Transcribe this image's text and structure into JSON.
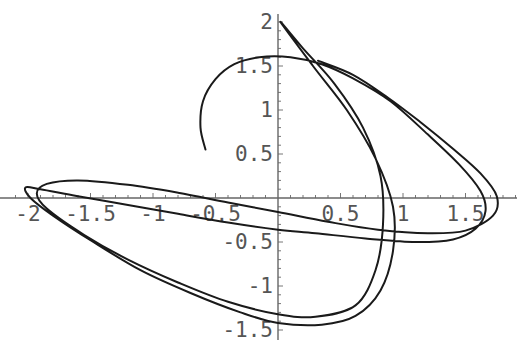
{
  "chart_data": {
    "type": "line",
    "title": "",
    "xlabel": "",
    "ylabel": "",
    "xlim": [
      -2.1,
      1.9
    ],
    "ylim": [
      -1.5,
      2.0
    ],
    "grid": false,
    "legend": null,
    "x_ticks": [
      "-2",
      "-1.5",
      "-1",
      "-0.5",
      "0.5",
      "1",
      "1.5"
    ],
    "y_ticks": [
      "2",
      "1.5",
      "1",
      "0.5",
      "-0.5",
      "-1",
      "-1.5"
    ],
    "series": [
      {
        "name": "parametric curve",
        "points": [
          [
            -0.58,
            0.55
          ],
          [
            -0.62,
            0.8
          ],
          [
            -0.6,
            1.1
          ],
          [
            -0.5,
            1.35
          ],
          [
            -0.35,
            1.52
          ],
          [
            -0.15,
            1.6
          ],
          [
            0.1,
            1.6
          ],
          [
            0.35,
            1.52
          ],
          [
            0.6,
            1.36
          ],
          [
            0.9,
            1.1
          ],
          [
            1.2,
            0.72
          ],
          [
            1.45,
            0.38
          ],
          [
            1.62,
            0.08
          ],
          [
            1.66,
            -0.15
          ],
          [
            1.58,
            -0.35
          ],
          [
            1.4,
            -0.47
          ],
          [
            1.1,
            -0.5
          ],
          [
            0.7,
            -0.46
          ],
          [
            0.3,
            -0.4
          ],
          [
            0.0,
            -0.36
          ],
          [
            -0.4,
            -0.28
          ],
          [
            -0.8,
            -0.18
          ],
          [
            -1.2,
            -0.08
          ],
          [
            -1.6,
            0.02
          ],
          [
            -1.9,
            0.1
          ],
          [
            -2.02,
            0.12
          ],
          [
            -1.98,
            0.0
          ],
          [
            -1.8,
            -0.2
          ],
          [
            -1.5,
            -0.48
          ],
          [
            -1.1,
            -0.82
          ],
          [
            -0.7,
            -1.08
          ],
          [
            -0.3,
            -1.3
          ],
          [
            0.0,
            -1.42
          ],
          [
            0.35,
            -1.44
          ],
          [
            0.62,
            -1.34
          ],
          [
            0.82,
            -1.05
          ],
          [
            0.92,
            -0.6
          ],
          [
            0.92,
            -0.1
          ],
          [
            0.78,
            0.45
          ],
          [
            0.55,
            1.0
          ],
          [
            0.28,
            1.5
          ],
          [
            0.02,
            2.0
          ],
          [
            0.2,
            1.7
          ],
          [
            0.45,
            1.3
          ],
          [
            0.68,
            0.8
          ],
          [
            0.82,
            0.25
          ],
          [
            0.84,
            -0.3
          ],
          [
            0.78,
            -0.82
          ],
          [
            0.62,
            -1.22
          ],
          [
            0.3,
            -1.35
          ],
          [
            0.0,
            -1.32
          ],
          [
            -0.4,
            -1.18
          ],
          [
            -0.8,
            -0.96
          ],
          [
            -1.2,
            -0.7
          ],
          [
            -1.55,
            -0.42
          ],
          [
            -1.85,
            -0.12
          ],
          [
            -1.93,
            0.05
          ],
          [
            -1.85,
            0.16
          ],
          [
            -1.6,
            0.2
          ],
          [
            -1.2,
            0.15
          ],
          [
            -0.8,
            0.06
          ],
          [
            -0.4,
            -0.05
          ],
          [
            0.0,
            -0.16
          ],
          [
            0.4,
            -0.27
          ],
          [
            0.8,
            -0.36
          ],
          [
            1.2,
            -0.4
          ],
          [
            1.5,
            -0.37
          ],
          [
            1.72,
            -0.2
          ],
          [
            1.75,
            0.02
          ],
          [
            1.62,
            0.28
          ],
          [
            1.4,
            0.56
          ],
          [
            1.15,
            0.85
          ],
          [
            0.88,
            1.14
          ],
          [
            0.6,
            1.4
          ],
          [
            0.32,
            1.56
          ]
        ]
      }
    ],
    "axis_origin_px": [
      278,
      198
    ],
    "px_per_unit": [
      125,
      88
    ]
  },
  "axes": {
    "x_tick_labels": [
      {
        "value": -2,
        "label": "-2"
      },
      {
        "value": -1.5,
        "label": "-1.5"
      },
      {
        "value": -1,
        "label": "-1"
      },
      {
        "value": -0.5,
        "label": "-0.5"
      },
      {
        "value": 0.5,
        "label": "0.5"
      },
      {
        "value": 1,
        "label": "1"
      },
      {
        "value": 1.5,
        "label": "1.5"
      }
    ],
    "y_tick_labels": [
      {
        "value": 2,
        "label": "2"
      },
      {
        "value": 1.5,
        "label": "1.5"
      },
      {
        "value": 1,
        "label": "1"
      },
      {
        "value": 0.5,
        "label": "0.5"
      },
      {
        "value": -0.5,
        "label": "-0.5"
      },
      {
        "value": -1,
        "label": "-1"
      },
      {
        "value": -1.5,
        "label": "-1.5"
      }
    ]
  }
}
